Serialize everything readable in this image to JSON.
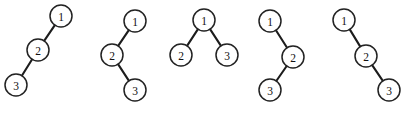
{
  "figure": {
    "width": 406,
    "height": 114,
    "background_color": "#ffffff",
    "node_fill_color": "#ffffff",
    "node_stroke_color": "#222222",
    "edge_color": "#1c1c1c",
    "label_color": "#111111",
    "node_radius": 11,
    "trees": [
      {
        "name": "tree-left-chain",
        "shape": "left-left chain",
        "nodes": [
          {
            "label": "1",
            "cx": 61,
            "cy": 16
          },
          {
            "label": "2",
            "cx": 38,
            "cy": 50
          },
          {
            "label": "3",
            "cx": 16,
            "cy": 85
          }
        ],
        "edges": [
          {
            "from": 0,
            "to": 1
          },
          {
            "from": 1,
            "to": 2
          }
        ]
      },
      {
        "name": "tree-left-right-zigzag",
        "shape": "left-right zigzag",
        "nodes": [
          {
            "label": "1",
            "cx": 135,
            "cy": 21
          },
          {
            "label": "2",
            "cx": 112,
            "cy": 55
          },
          {
            "label": "3",
            "cx": 135,
            "cy": 90
          }
        ],
        "edges": [
          {
            "from": 0,
            "to": 1
          },
          {
            "from": 1,
            "to": 2
          }
        ]
      },
      {
        "name": "tree-balanced",
        "shape": "balanced",
        "nodes": [
          {
            "label": "1",
            "cx": 204,
            "cy": 20
          },
          {
            "label": "2",
            "cx": 181,
            "cy": 55
          },
          {
            "label": "3",
            "cx": 227,
            "cy": 55
          }
        ],
        "edges": [
          {
            "from": 0,
            "to": 1
          },
          {
            "from": 0,
            "to": 2
          }
        ]
      },
      {
        "name": "tree-right-left-zigzag",
        "shape": "right-left zigzag",
        "nodes": [
          {
            "label": "1",
            "cx": 270,
            "cy": 21
          },
          {
            "label": "2",
            "cx": 293,
            "cy": 57
          },
          {
            "label": "3",
            "cx": 270,
            "cy": 90
          }
        ],
        "edges": [
          {
            "from": 0,
            "to": 1
          },
          {
            "from": 1,
            "to": 2
          }
        ]
      },
      {
        "name": "tree-right-chain",
        "shape": "right-right chain",
        "nodes": [
          {
            "label": "1",
            "cx": 344,
            "cy": 20
          },
          {
            "label": "2",
            "cx": 366,
            "cy": 56
          },
          {
            "label": "3",
            "cx": 389,
            "cy": 90
          }
        ],
        "edges": [
          {
            "from": 0,
            "to": 1
          },
          {
            "from": 1,
            "to": 2
          }
        ]
      }
    ]
  }
}
